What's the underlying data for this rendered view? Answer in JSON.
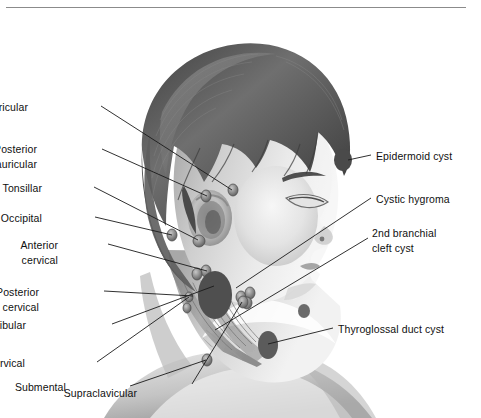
{
  "figure": {
    "style": "grayscale medical illustration",
    "border_color": "#8b8b8b",
    "background_color": "#ffffff",
    "text_color": "#101010",
    "leader_line_color": "#1a1a1a",
    "mass_color": "#545454",
    "node_color": "#6e6e6e"
  },
  "left_labels": [
    {
      "id": "preauricular",
      "text": "Preauricular",
      "lines": [
        "Preauricular"
      ],
      "x": 28,
      "y": 100
    },
    {
      "id": "posterior-auricular",
      "text": "Posterior auricular",
      "lines": [
        "Posterior",
        "auricular"
      ],
      "x": 37,
      "y": 142
    },
    {
      "id": "tonsillar",
      "text": "Tonsillar",
      "lines": [
        "Tonsillar"
      ],
      "x": 42,
      "y": 181
    },
    {
      "id": "occipital",
      "text": "Occipital",
      "lines": [
        "Occipital"
      ],
      "x": 42,
      "y": 211
    },
    {
      "id": "anterior-cervical",
      "text": "Anterior cervical",
      "lines": [
        "Anterior",
        "cervical"
      ],
      "x": 58,
      "y": 238
    },
    {
      "id": "posterior-cervical",
      "text": "Posterior cervical",
      "lines": [
        "Posterior",
        "cervical"
      ],
      "x": 39,
      "y": 285
    },
    {
      "id": "submandibular",
      "text": "Submandibular",
      "lines": [
        "Submandibular"
      ],
      "x": 26,
      "y": 318
    },
    {
      "id": "deep-cervical",
      "text": "Deep cervical",
      "lines": [
        "Deep cervical"
      ],
      "x": 25,
      "y": 356
    },
    {
      "id": "submental",
      "text": "Submental",
      "lines": [
        "Submental"
      ],
      "x": 66,
      "y": 380
    },
    {
      "id": "supraclavicular",
      "text": "Supraclavicular",
      "lines": [
        "Supraclavicular"
      ],
      "x": 137,
      "y": 386
    }
  ],
  "right_labels": [
    {
      "id": "epidermoid-cyst",
      "text": "Epidermoid cyst",
      "lines": [
        "Epidermoid cyst"
      ],
      "x": 376,
      "y": 149
    },
    {
      "id": "cystic-hygroma",
      "text": "Cystic hygroma",
      "lines": [
        "Cystic hygroma"
      ],
      "x": 376,
      "y": 192
    },
    {
      "id": "second-branchial-cleft-cyst",
      "text": "2nd branchial cleft cyst",
      "lines": [
        "2nd branchial",
        "cleft cyst"
      ],
      "x": 372,
      "y": 226
    },
    {
      "id": "thyroglossal-duct-cyst",
      "text": "Thyroglossal duct cyst",
      "lines": [
        "Thyroglossal duct cyst"
      ],
      "x": 338,
      "y": 322
    }
  ],
  "leader_lines": [
    {
      "id": "leader-preauricular",
      "x1": 101,
      "y1": 106,
      "x2": 232,
      "y2": 190
    },
    {
      "id": "leader-posterior-auricular",
      "x1": 102,
      "y1": 149,
      "x2": 207,
      "y2": 196
    },
    {
      "id": "leader-tonsillar",
      "x1": 94,
      "y1": 187,
      "x2": 198,
      "y2": 240
    },
    {
      "id": "leader-occipital",
      "x1": 95,
      "y1": 217,
      "x2": 172,
      "y2": 235
    },
    {
      "id": "leader-anterior-cervical",
      "x1": 108,
      "y1": 244,
      "x2": 207,
      "y2": 271
    },
    {
      "id": "leader-posterior-cervical",
      "x1": 104,
      "y1": 291,
      "x2": 193,
      "y2": 296
    },
    {
      "id": "leader-submandibular",
      "x1": 112,
      "y1": 324,
      "x2": 214,
      "y2": 286
    },
    {
      "id": "leader-deep-cervical",
      "x1": 97,
      "y1": 362,
      "x2": 189,
      "y2": 297
    },
    {
      "id": "leader-submental",
      "x1": 130,
      "y1": 386,
      "x2": 206,
      "y2": 360
    },
    {
      "id": "leader-supraclavicular",
      "x1": 192,
      "y1": 384,
      "x2": 242,
      "y2": 302
    },
    {
      "id": "leader-epidermoid-cyst",
      "x1": 371,
      "y1": 155,
      "x2": 348,
      "y2": 160
    },
    {
      "id": "leader-cystic-hygroma",
      "x1": 371,
      "y1": 198,
      "x2": 236,
      "y2": 288
    },
    {
      "id": "leader-2nd-branchial",
      "x1": 368,
      "y1": 238,
      "x2": 215,
      "y2": 330
    },
    {
      "id": "leader-thyroglossal",
      "x1": 333,
      "y1": 328,
      "x2": 268,
      "y2": 344
    }
  ],
  "masses": [
    {
      "id": "mass-epidermoid-cyst",
      "cx": 343,
      "cy": 160,
      "rx": 9,
      "ry": 11,
      "fill": "#4a4a4a"
    },
    {
      "id": "mass-cystic-hygroma",
      "cx": 215,
      "cy": 295,
      "rx": 17,
      "ry": 24,
      "fill": "#4f4f4f"
    },
    {
      "id": "mass-branchial-cleft",
      "cx": 304,
      "cy": 311,
      "rx": 6,
      "ry": 7,
      "fill": "#6a6a6a"
    },
    {
      "id": "mass-thyroglossal-duct",
      "cx": 268,
      "cy": 345,
      "rx": 10,
      "ry": 14,
      "fill": "#5b5b5b"
    }
  ],
  "nodes": [
    {
      "id": "node-preauricular",
      "cx": 233,
      "cy": 190,
      "rx": 5,
      "ry": 6
    },
    {
      "id": "node-posterior-auricular",
      "cx": 206,
      "cy": 196,
      "rx": 5,
      "ry": 6
    },
    {
      "id": "node-occipital",
      "cx": 172,
      "cy": 235,
      "rx": 5,
      "ry": 6
    },
    {
      "id": "node-tonsillar",
      "cx": 199,
      "cy": 241,
      "rx": 6,
      "ry": 6
    },
    {
      "id": "node-anterior-cervical-a",
      "cx": 206,
      "cy": 271,
      "rx": 5,
      "ry": 6
    },
    {
      "id": "node-anterior-cervical-b",
      "cx": 197,
      "cy": 274,
      "rx": 5,
      "ry": 6
    },
    {
      "id": "node-submandibular-a",
      "cx": 241,
      "cy": 297,
      "rx": 5,
      "ry": 6
    },
    {
      "id": "node-submandibular-b",
      "cx": 250,
      "cy": 293,
      "rx": 5,
      "ry": 6
    },
    {
      "id": "node-submandibular-c",
      "cx": 247,
      "cy": 303,
      "rx": 5,
      "ry": 6
    },
    {
      "id": "node-deep-cervical-a",
      "cx": 189,
      "cy": 297,
      "rx": 4,
      "ry": 5
    },
    {
      "id": "node-deep-cervical-b",
      "cx": 187,
      "cy": 308,
      "rx": 4,
      "ry": 5
    },
    {
      "id": "node-submental",
      "cx": 207,
      "cy": 360,
      "rx": 5,
      "ry": 6
    },
    {
      "id": "node-supraclavicular",
      "cx": 243,
      "cy": 302,
      "rx": 5,
      "ry": 6
    }
  ]
}
